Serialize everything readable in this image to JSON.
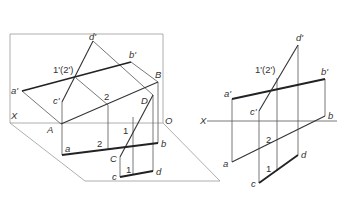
{
  "figure": {
    "left_view": {
      "description": "oblique projection of two planes intersecting",
      "labels": {
        "X": "X",
        "O": "O",
        "a_prime": "a'",
        "b_prime": "b'",
        "c_prime": "c'",
        "d_prime": "d'",
        "one_two_prime": "1'(2')",
        "A": "A",
        "B": "B",
        "C": "C",
        "D": "D",
        "pt2_space": "2",
        "pt1_space": "1",
        "a": "a",
        "b": "b",
        "c": "c",
        "d": "d",
        "pt2_h": "2",
        "pt1_h": "1"
      }
    },
    "right_view": {
      "description": "orthographic projection with X axis",
      "labels": {
        "X": "X",
        "a_prime": "a'",
        "b_prime": "b'",
        "c_prime": "c'",
        "d_prime": "d'",
        "one_two_prime": "1'(2')",
        "a": "a",
        "b": "b",
        "c": "c",
        "d": "d",
        "pt2": "2",
        "pt1": "1"
      }
    }
  }
}
